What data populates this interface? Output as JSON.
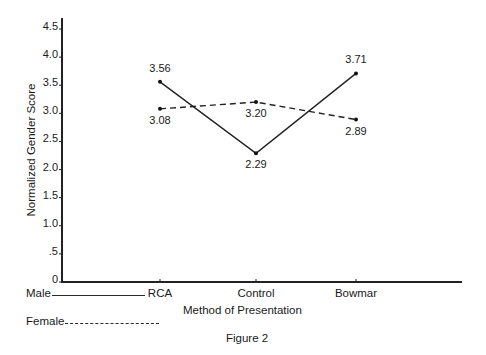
{
  "chart_data": {
    "type": "line",
    "title": "",
    "caption": "Figure 2",
    "xlabel": "Method of Presentation",
    "ylabel": "Normalized Gender Score",
    "categories": [
      "RCA",
      "Control",
      "Bowmar"
    ],
    "series": [
      {
        "name": "Male",
        "style": "solid",
        "values": [
          3.56,
          2.29,
          3.71
        ]
      },
      {
        "name": "Female",
        "style": "dashed",
        "values": [
          3.08,
          3.2,
          2.89
        ]
      }
    ],
    "yticks": [
      "0",
      ".5",
      "1.0",
      "1.5",
      "2.0",
      "2.5",
      "3.0",
      "3.5",
      "4.0",
      "4.5"
    ],
    "ylim": [
      0,
      4.5
    ],
    "grid": false,
    "legend_position": "bottom-left"
  },
  "legend": {
    "male_label": "Male",
    "female_label": "Female"
  },
  "axis": {
    "x_title": "Method of Presentation",
    "y_title": "Normalized Gender Score"
  },
  "figure": {
    "caption": "Figure 2"
  },
  "colors": {
    "ink": "#1a1a1a",
    "background": "#ffffff"
  }
}
